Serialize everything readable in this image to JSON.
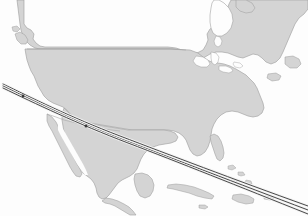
{
  "figure": {
    "type": "map",
    "width": 308,
    "height": 216,
    "projection": "equirectangular-like",
    "has_labels": false,
    "has_legend": false,
    "has_graticule": false,
    "has_border_frame": false
  },
  "colors": {
    "ocean": "#fdfdfd",
    "land_fill": "#d4d4d4",
    "land_stroke": "#9a9a9a",
    "internal_border": "#a8a8a8",
    "route_line": "#2b2b2b",
    "route_halo": "#f2f2f2",
    "marker": "#3a3a3a"
  },
  "landmasses": [
    {
      "name": "canada-mainland",
      "region": "Canada"
    },
    {
      "name": "united-states-mainland",
      "region": "United States"
    },
    {
      "name": "mexico-mainland",
      "region": "Mexico"
    },
    {
      "name": "baja-california-peninsula",
      "region": "Mexico"
    },
    {
      "name": "central-america",
      "region": "Central America"
    },
    {
      "name": "yucatan-peninsula",
      "region": "Mexico"
    },
    {
      "name": "florida-peninsula",
      "region": "United States"
    },
    {
      "name": "vancouver-island",
      "region": "Canada"
    },
    {
      "name": "cuba",
      "region": "Caribbean"
    },
    {
      "name": "hispaniola",
      "region": "Caribbean"
    },
    {
      "name": "jamaica",
      "region": "Caribbean"
    },
    {
      "name": "puerto-rico",
      "region": "Caribbean"
    },
    {
      "name": "bahamas",
      "region": "Caribbean"
    },
    {
      "name": "newfoundland",
      "region": "Canada"
    },
    {
      "name": "nova-scotia",
      "region": "Canada"
    },
    {
      "name": "hudson-bay-coast",
      "region": "Canada"
    },
    {
      "name": "great-lakes",
      "region": "United States / Canada"
    }
  ],
  "borders": [
    {
      "name": "us-canada-border-49th-parallel",
      "type": "straight-line"
    },
    {
      "name": "us-mexico-border",
      "type": "irregular"
    }
  ],
  "routes": {
    "count": 3,
    "style": "great-circle-arc",
    "origin_region": "Southern California",
    "destination_region": "Caribbean / Lesser Antilles",
    "paths": [
      {
        "name": "route-arc-1"
      },
      {
        "name": "route-arc-2"
      },
      {
        "name": "route-arc-3"
      }
    ]
  },
  "markers": [
    {
      "name": "route-waypoint-west",
      "region": "Southern California coast"
    },
    {
      "name": "route-waypoint-mid",
      "region": "Northern Mexico"
    }
  ]
}
